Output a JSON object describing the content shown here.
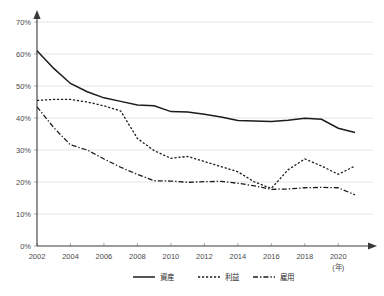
{
  "chart_data": {
    "type": "line",
    "title": "",
    "xlabel": "(年)",
    "ylabel": "",
    "xlim": [
      2002,
      2021
    ],
    "ylim": [
      0,
      70
    ],
    "grid": true,
    "legend_position": "bottom",
    "x": [
      2002,
      2003,
      2004,
      2005,
      2006,
      2007,
      2008,
      2009,
      2010,
      2011,
      2012,
      2013,
      2014,
      2015,
      2016,
      2017,
      2018,
      2019,
      2020,
      2021
    ],
    "x_tick_labels": [
      "2002",
      "2004",
      "2006",
      "2008",
      "2010",
      "2012",
      "2014",
      "2016",
      "2018",
      "2020"
    ],
    "y_tick_labels": [
      "0%",
      "10%",
      "20%",
      "30%",
      "40%",
      "50%",
      "60%",
      "70%"
    ],
    "y_ticks": [
      0,
      10,
      20,
      30,
      40,
      50,
      60,
      70
    ],
    "series": [
      {
        "name": "資産",
        "style": "solid",
        "color": "#1c1c1c",
        "values": [
          61.0,
          55.5,
          50.8,
          48.2,
          46.3,
          45.2,
          44.1,
          43.8,
          42.0,
          41.9,
          41.2,
          40.3,
          39.2,
          39.1,
          38.9,
          39.3,
          39.9,
          39.6,
          36.8,
          35.5
        ]
      },
      {
        "name": "利益",
        "style": "dotted",
        "color": "#1c1c1c",
        "values": [
          45.5,
          45.8,
          45.8,
          45.0,
          43.8,
          42.2,
          33.6,
          29.8,
          27.4,
          28.0,
          26.4,
          24.8,
          23.2,
          20.0,
          18.0,
          23.8,
          27.2,
          25.0,
          22.4,
          25.0
        ]
      },
      {
        "name": "雇用",
        "style": "dashdot",
        "color": "#1c1c1c",
        "values": [
          43.5,
          37.0,
          31.6,
          30.0,
          27.2,
          24.6,
          22.4,
          20.4,
          20.3,
          19.9,
          20.1,
          20.2,
          19.6,
          18.8,
          17.7,
          17.8,
          18.2,
          18.3,
          18.2,
          16.0
        ]
      }
    ]
  },
  "legend": {
    "items": [
      {
        "label": "資産",
        "style": "solid"
      },
      {
        "label": "利益",
        "style": "dotted"
      },
      {
        "label": "雇用",
        "style": "dashdot"
      }
    ]
  },
  "axis": {
    "x_unit": "(年)"
  }
}
